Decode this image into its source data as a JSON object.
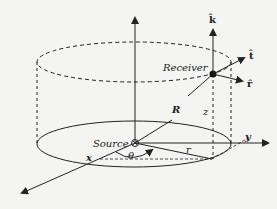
{
  "diagram": {
    "labels": {
      "source": "Source",
      "receiver": "Receiver",
      "R": "R",
      "z": "z",
      "r": "r",
      "x": "x",
      "y": "y",
      "theta": "θ",
      "k_hat": "k̂",
      "t_hat": "t̂",
      "r_hat": "r̂"
    },
    "colors": {
      "line": "#222222",
      "background": "#f4f4f2"
    }
  }
}
